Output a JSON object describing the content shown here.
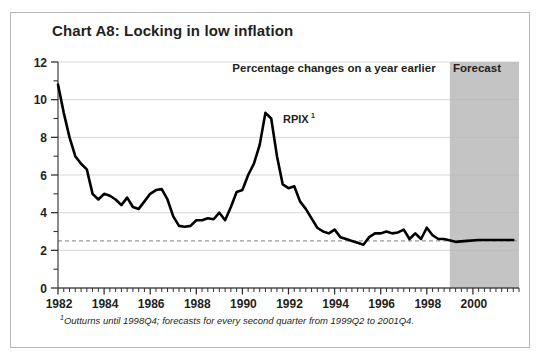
{
  "figure": {
    "title": "Chart A8: Locking in low inflation",
    "subtitle": "Percentage changes on a year earlier",
    "forecast_band_label": "Forecast",
    "series_label": "RPIX",
    "series_label_sup": "1",
    "footnote_sup": "1",
    "footnote": "Outturns until 1998Q4; forecasts for every second quarter from 1999Q2 to 2001Q4.",
    "colors": {
      "line": "#000000",
      "forecast_band": "#b3b3b3",
      "gridline": "#d8d8d8",
      "target_line": "#808080",
      "frame_border": "#b7b7b7",
      "text": "#231f20",
      "background": "#ffffff"
    }
  },
  "chart_data": {
    "type": "line",
    "title": "Chart A8: Locking in low inflation",
    "subtitle": "Percentage changes on a year earlier",
    "xlabel": "",
    "ylabel": "",
    "xlim": [
      1982.0,
      2002.0
    ],
    "ylim": [
      0,
      12
    ],
    "ytick_labels": [
      "0",
      "2",
      "4",
      "6",
      "8",
      "10",
      "12"
    ],
    "ytick_values": [
      0,
      2,
      4,
      6,
      8,
      10,
      12
    ],
    "yminor_tick_values": [
      1,
      3,
      5,
      7,
      9,
      11
    ],
    "xtick_labels": [
      "1982",
      "1984",
      "1986",
      "1988",
      "1990",
      "1992",
      "1994",
      "1996",
      "1998",
      "2000"
    ],
    "xtick_values": [
      1982,
      1984,
      1986,
      1988,
      1990,
      1992,
      1994,
      1996,
      1998,
      2000
    ],
    "xminor_tick_interval_years": 0.25,
    "grid": "horizontal-major-only",
    "legend": "inline-annotation",
    "annotations": [
      {
        "text": "Percentage changes on a year earlier",
        "x": 1990.3,
        "y": 11.3
      },
      {
        "text": "RPIX",
        "x": 1991.1,
        "y": 8.45
      }
    ],
    "reference_lines": [
      {
        "name": "inflation-target",
        "value": 2.5,
        "style": "dashed",
        "orientation": "horizontal"
      }
    ],
    "shaded_regions": [
      {
        "name": "forecast-band",
        "x_start": 1999.0,
        "x_end": 2002.0,
        "label": "Forecast"
      }
    ],
    "series": [
      {
        "name": "RPIX",
        "x": [
          1982.0,
          1982.25,
          1982.5,
          1982.75,
          1983.0,
          1983.25,
          1983.5,
          1983.75,
          1984.0,
          1984.25,
          1984.5,
          1984.75,
          1985.0,
          1985.25,
          1985.5,
          1985.75,
          1986.0,
          1986.25,
          1986.5,
          1986.75,
          1987.0,
          1987.25,
          1987.5,
          1987.75,
          1988.0,
          1988.25,
          1988.5,
          1988.75,
          1989.0,
          1989.25,
          1989.5,
          1989.75,
          1990.0,
          1990.25,
          1990.5,
          1990.75,
          1991.0,
          1991.25,
          1991.5,
          1991.75,
          1992.0,
          1992.25,
          1992.5,
          1992.75,
          1993.0,
          1993.25,
          1993.5,
          1993.75,
          1994.0,
          1994.25,
          1994.5,
          1994.75,
          1995.0,
          1995.25,
          1995.5,
          1995.75,
          1996.0,
          1996.25,
          1996.5,
          1996.75,
          1997.0,
          1997.25,
          1997.5,
          1997.75,
          1998.0,
          1998.25,
          1998.5,
          1998.75,
          1999.25,
          1999.75,
          2000.25,
          2000.75,
          2001.25,
          2001.75
        ],
        "y": [
          10.8,
          9.3,
          8.0,
          7.0,
          6.6,
          6.3,
          5.0,
          4.7,
          5.0,
          4.9,
          4.7,
          4.4,
          4.8,
          4.3,
          4.2,
          4.6,
          5.0,
          5.2,
          5.25,
          4.7,
          3.8,
          3.3,
          3.25,
          3.3,
          3.6,
          3.6,
          3.7,
          3.65,
          4.0,
          3.6,
          4.3,
          5.1,
          5.2,
          6.0,
          6.6,
          7.6,
          9.3,
          9.0,
          7.0,
          5.5,
          5.3,
          5.4,
          4.6,
          4.2,
          3.7,
          3.2,
          3.0,
          2.9,
          3.1,
          2.7,
          2.6,
          2.5,
          2.4,
          2.3,
          2.7,
          2.9,
          2.9,
          3.0,
          2.9,
          2.95,
          3.1,
          2.6,
          2.9,
          2.6,
          3.2,
          2.8,
          2.6,
          2.6,
          2.45,
          2.5,
          2.55,
          2.55,
          2.55,
          2.55
        ]
      }
    ],
    "footnote": "1Outturns until 1998Q4; forecasts for every second quarter from 1999Q2 to 2001Q4."
  },
  "plot_geometry": {
    "x_left_px": 58,
    "x_right_px": 519,
    "y_top_px": 62,
    "y_bottom_px": 288
  }
}
